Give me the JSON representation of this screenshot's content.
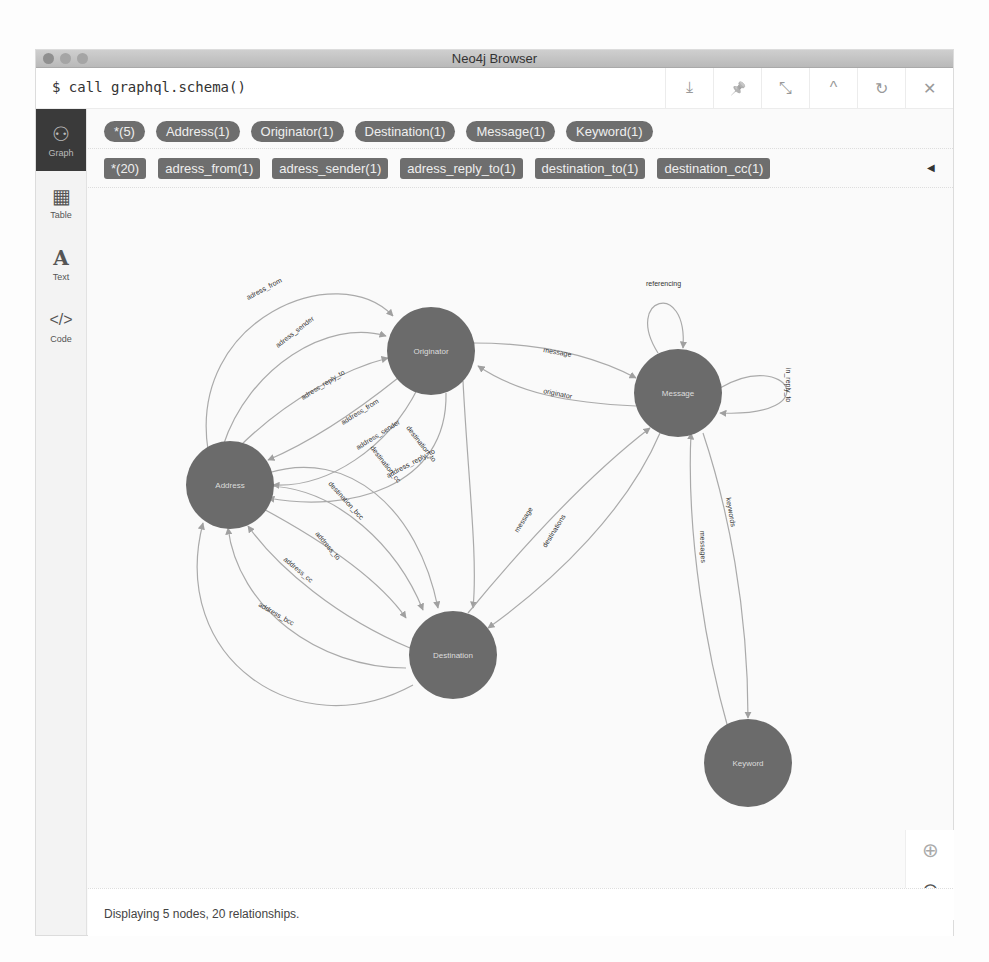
{
  "window": {
    "title": "Neo4j Browser"
  },
  "command": {
    "text": "$ call graphql.schema()"
  },
  "frame_actions": [
    {
      "name": "download-icon",
      "glyph": "⤓"
    },
    {
      "name": "pin-icon",
      "glyph": "📌"
    },
    {
      "name": "collapse-arrows-icon",
      "glyph": "⤡"
    },
    {
      "name": "chevron-up-icon",
      "glyph": "^"
    },
    {
      "name": "rerun-icon",
      "glyph": "↻"
    },
    {
      "name": "close-icon",
      "glyph": "✕"
    }
  ],
  "sidebar": {
    "items": [
      {
        "label": "Graph",
        "icon": "graph-icon",
        "glyph": "⚇",
        "active": true
      },
      {
        "label": "Table",
        "icon": "table-icon",
        "glyph": "▦",
        "active": false
      },
      {
        "label": "Text",
        "icon": "text-icon",
        "glyph": "A",
        "active": false
      },
      {
        "label": "Code",
        "icon": "code-icon",
        "glyph": "</>",
        "active": false
      }
    ]
  },
  "node_labels": [
    {
      "label": "*(5)"
    },
    {
      "label": "Address(1)"
    },
    {
      "label": "Originator(1)"
    },
    {
      "label": "Destination(1)"
    },
    {
      "label": "Message(1)"
    },
    {
      "label": "Keyword(1)"
    }
  ],
  "relationship_types": [
    {
      "label": "*(20)"
    },
    {
      "label": "adress_from(1)"
    },
    {
      "label": "adress_sender(1)"
    },
    {
      "label": "adress_reply_to(1)"
    },
    {
      "label": "destination_to(1)"
    },
    {
      "label": "destination_cc(1)"
    }
  ],
  "legend_toggle": "◀",
  "graph": {
    "node_color": "#6b6b6b",
    "edge_color": "#a8a8a8",
    "nodes": [
      {
        "id": "Address",
        "label": "Address"
      },
      {
        "id": "Originator",
        "label": "Originator"
      },
      {
        "id": "Destination",
        "label": "Destination"
      },
      {
        "id": "Message",
        "label": "Message"
      },
      {
        "id": "Keyword",
        "label": "Keyword"
      }
    ],
    "edge_labels": {
      "adress_from": "adress_from",
      "adress_sender": "adress_sender",
      "adress_reply_to": "adress_reply_to",
      "address_from": "address_from",
      "address_sender": "address_sender",
      "address_reply_to": "address_reply_to",
      "destination_to": "destination_to",
      "destination_cc": "destination_cc",
      "destination_bcc": "destination_bcc",
      "address_to": "address_to",
      "address_cc": "address_cc",
      "address_bcc": "address_bcc",
      "message_orig": "message",
      "originator": "originator",
      "referencing": "referencing",
      "in_reply_to": "in_reply_to",
      "message_dest": "message",
      "destinations": "destinations",
      "messages": "messages",
      "keywords": "keywords"
    }
  },
  "zoom_controls": {
    "zoom_in": "⊕",
    "zoom_out": "⊖"
  },
  "status": {
    "text": "Displaying 5 nodes, 20 relationships."
  }
}
